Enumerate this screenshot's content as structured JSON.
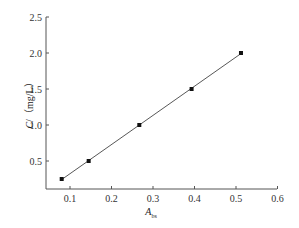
{
  "chart_data": {
    "type": "scatter",
    "title": "",
    "xlabel": "A_bs",
    "xlabel_main": "A",
    "xlabel_sub": "bs",
    "ylabel": "C/（mg/L）",
    "ylabel_var": "C",
    "ylabel_unit": "/（mg/L）",
    "xlim": [
      0.05,
      0.6
    ],
    "ylim": [
      0.1,
      2.5
    ],
    "x_ticks": [
      "0.1",
      "0.2",
      "0.3",
      "0.4",
      "0.5",
      "0.6"
    ],
    "y_ticks": [
      "0.5",
      "1.0",
      "1.5",
      "2.0",
      "2.5"
    ],
    "grid": false,
    "legend": null,
    "series": [
      {
        "name": "calibration",
        "marker": "square",
        "fit_line": true,
        "x": [
          0.08,
          0.145,
          0.267,
          0.393,
          0.512
        ],
        "y": [
          0.25,
          0.5,
          1.0,
          1.5,
          2.0
        ]
      }
    ],
    "colors": {
      "axis": "#555555",
      "line": "#444444",
      "marker": "#111111"
    }
  }
}
